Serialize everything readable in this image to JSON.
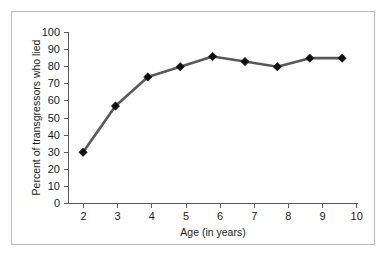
{
  "figure": {
    "background_color": "#ffffff",
    "frame_color": "#b9b9b9"
  },
  "chart_data": {
    "type": "line",
    "title": "",
    "subtitle": "",
    "xlabel": "Age (in years)",
    "ylabel": "Percent of transgressors who lied",
    "x": [
      2,
      3,
      4,
      5,
      6,
      7,
      8,
      9,
      10
    ],
    "xtick_labels": [
      "2",
      "3",
      "4",
      "5",
      "6",
      "7",
      "8",
      "9",
      "10"
    ],
    "ytick_labels": [
      "0",
      "10",
      "20",
      "30",
      "40",
      "50",
      "60",
      "70",
      "80",
      "90",
      "100"
    ],
    "yticks": [
      0,
      10,
      20,
      30,
      40,
      50,
      60,
      70,
      80,
      90,
      100
    ],
    "values": [
      30,
      57,
      74,
      80,
      86,
      83,
      80,
      85,
      85
    ],
    "series": [
      {
        "name": "Percent of transgressors who lied",
        "values": [
          30,
          57,
          74,
          80,
          86,
          83,
          80,
          85,
          85
        ],
        "line_color": "#595959",
        "marker": "diamond",
        "marker_color": "#101010"
      }
    ],
    "xlim": [
      1.55,
      10.45
    ],
    "ylim": [
      0,
      100
    ],
    "grid": false,
    "legend": false,
    "legend_position": "none",
    "annotations": []
  }
}
